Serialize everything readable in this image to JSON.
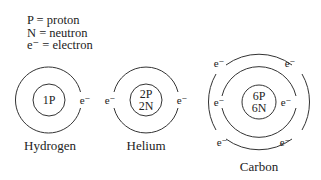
{
  "legend": [
    {
      "symbol": "P",
      "meaning": "proton",
      "text": "P = proton"
    },
    {
      "symbol": "N",
      "meaning": "neutron",
      "text": "N = neutron"
    },
    {
      "symbol": "e⁻",
      "meaning": "electron",
      "text": "e⁻ = electron"
    }
  ],
  "electron_label": "e⁻",
  "atoms": [
    {
      "name": "Hydrogen",
      "nucleus_line1": "1P",
      "nucleus_line2": "",
      "electrons": 1,
      "shells": 1
    },
    {
      "name": "Helium",
      "nucleus_line1": "2P",
      "nucleus_line2": "2N",
      "electrons": 2,
      "shells": 1
    },
    {
      "name": "Carbon",
      "nucleus_line1": "6P",
      "nucleus_line2": "6N",
      "electrons": 6,
      "shells": 2
    }
  ],
  "colors": {
    "line": "#333333",
    "text": "#222222",
    "background": "#ffffff"
  }
}
